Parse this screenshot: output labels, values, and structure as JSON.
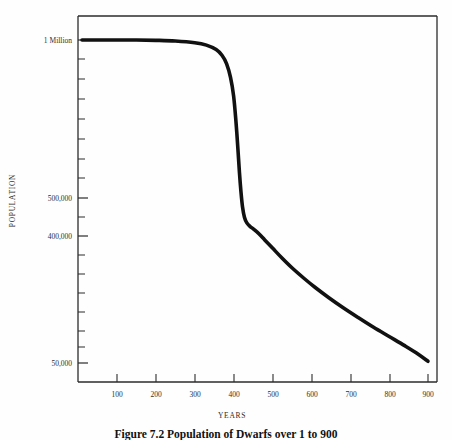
{
  "figure": {
    "caption": "Figure 7.2   Population of Dwarfs over 1 to 900",
    "background_color": "#fefefe",
    "line_color": "#111111",
    "axis_color": "#2b2b2b"
  },
  "chart_data": {
    "type": "line",
    "title": "",
    "subtitle": "",
    "xlabel": "YEARS",
    "ylabel": "POPULATION",
    "xlim": [
      0,
      950
    ],
    "ylim": [
      0,
      1000000
    ],
    "grid": false,
    "legend": null,
    "xticks": [
      100,
      200,
      300,
      400,
      500,
      600,
      700,
      800,
      900
    ],
    "xtick_labels": [
      "100",
      "200",
      "300",
      "400",
      "500",
      "600",
      "700",
      "800",
      "900"
    ],
    "yticks": [
      1000000,
      500000,
      400000,
      50000
    ],
    "ytick_labels": [
      "1 Million",
      "500,000",
      "400,000",
      "50,000"
    ],
    "y_minor_tick_count": 17,
    "series": [
      {
        "name": "Population of Dwarfs",
        "x": [
          10,
          50,
          100,
          150,
          200,
          250,
          300,
          330,
          355,
          370,
          382,
          392,
          400,
          406,
          411,
          415,
          419,
          423,
          428,
          434,
          442,
          452,
          465,
          480,
          500,
          525,
          550,
          580,
          610,
          645,
          680,
          720,
          760,
          800,
          840,
          875,
          900
        ],
        "values": [
          1000000,
          1000000,
          1000000,
          1000000,
          999000,
          997000,
          992000,
          985000,
          972000,
          955000,
          930000,
          890000,
          835000,
          760000,
          680000,
          610000,
          552000,
          508000,
          478000,
          462000,
          452000,
          443000,
          430000,
          412000,
          388000,
          358000,
          330000,
          300000,
          272000,
          242000,
          214000,
          184000,
          155000,
          128000,
          101000,
          76000,
          55000
        ]
      }
    ],
    "annotations": [
      {
        "text": "plateau at 1 Million until ~year 380"
      },
      {
        "text": "steep collapse between year 390 and year 440"
      },
      {
        "text": "gradual decline from ~450,000 down to ~55,000 by year 900"
      }
    ]
  },
  "axes": {
    "y_labels": [
      {
        "text": "1 Million",
        "value": 1000000,
        "top": 36
      },
      {
        "text": "500,000",
        "value": 500000,
        "top": 194
      },
      {
        "text": "400,000",
        "value": 400000,
        "top": 232
      },
      {
        "text": "50,000",
        "value": 50000,
        "top": 359
      }
    ],
    "x_labels": [
      {
        "text": "100",
        "value": 100,
        "left": 107
      },
      {
        "text": "200",
        "value": 200,
        "left": 145
      },
      {
        "text": "300",
        "value": 300,
        "left": 184
      },
      {
        "text": "400",
        "value": 400,
        "left": 223
      },
      {
        "text": "500",
        "value": 500,
        "left": 262
      },
      {
        "text": "600",
        "value": 600,
        "left": 301
      },
      {
        "text": "700",
        "value": 700,
        "left": 340
      },
      {
        "text": "800",
        "value": 800,
        "left": 379
      },
      {
        "text": "900",
        "value": 900,
        "left": 417
      }
    ]
  }
}
